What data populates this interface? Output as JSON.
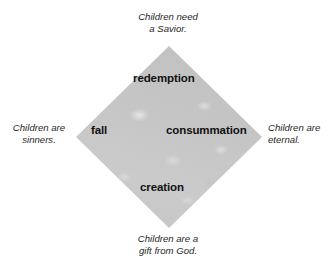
{
  "diagram": {
    "shape": "diamond",
    "fill_color": "#c4c4c4",
    "text_color": "#111111",
    "caption_color": "#262626",
    "background_color": "#ffffff",
    "inner_labels": [
      {
        "id": "redemption",
        "text": "redemption",
        "position": "top"
      },
      {
        "id": "fall",
        "text": "fall",
        "position": "left"
      },
      {
        "id": "consummation",
        "text": "consummation",
        "position": "right"
      },
      {
        "id": "creation",
        "text": "creation",
        "position": "bottom"
      }
    ],
    "outer_captions": [
      {
        "id": "top",
        "position": "top",
        "line1": "Children need",
        "line2": "a Savior."
      },
      {
        "id": "left",
        "position": "left",
        "line1": "Children are",
        "line2": "sinners."
      },
      {
        "id": "right",
        "position": "right",
        "line1": "Children are",
        "line2": "eternal."
      },
      {
        "id": "bottom",
        "position": "bottom",
        "line1": "Children are a",
        "line2": "gift from God."
      }
    ]
  }
}
